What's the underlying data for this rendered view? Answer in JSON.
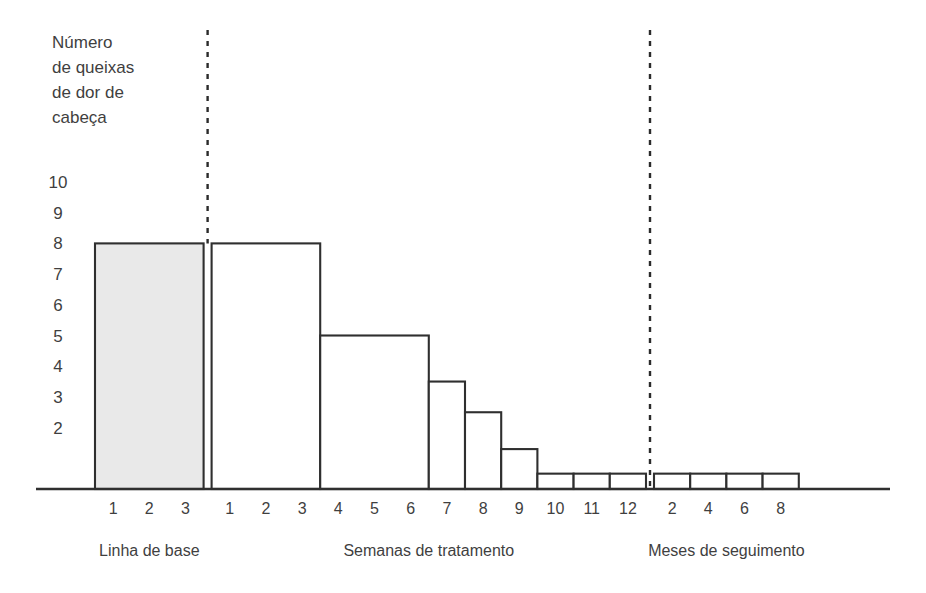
{
  "chart_data": {
    "type": "bar",
    "title": "",
    "ylabel": "Número de queixas de dor de cabeça",
    "ylabel_lines": [
      "Número",
      "de queixas",
      "de dor de",
      "cabeça"
    ],
    "xlabel": "",
    "ylim": [
      0,
      10
    ],
    "grid": false,
    "legend": "none",
    "y_ticks": [
      10,
      9,
      8,
      7,
      6,
      5,
      4,
      3,
      2
    ],
    "bar_fill_shaded": "#e9e9e9",
    "bar_fill_plain": "#ffffff",
    "bar_stroke": "#2f2f2f",
    "sections": [
      {
        "name": "baseline",
        "label": "Linha de base",
        "tick_labels": [
          "1",
          "2",
          "3"
        ],
        "bars": [
          {
            "label": "1-3",
            "span": 3,
            "value": 8,
            "shaded": true
          }
        ]
      },
      {
        "name": "treatment",
        "label": "Semanas de tratamento",
        "tick_labels": [
          "1",
          "2",
          "3",
          "4",
          "5",
          "6",
          "7",
          "8",
          "9",
          "10",
          "11",
          "12"
        ],
        "bars": [
          {
            "label": "1-3",
            "span": 3,
            "value": 8,
            "shaded": false
          },
          {
            "label": "4-6",
            "span": 3,
            "value": 5,
            "shaded": false
          },
          {
            "label": "7",
            "span": 1,
            "value": 3.5,
            "shaded": false
          },
          {
            "label": "8",
            "span": 1,
            "value": 2.5,
            "shaded": false
          },
          {
            "label": "9",
            "span": 1,
            "value": 1.3,
            "shaded": false
          },
          {
            "label": "10",
            "span": 1,
            "value": 0.5,
            "shaded": false
          },
          {
            "label": "11",
            "span": 1,
            "value": 0.5,
            "shaded": false
          },
          {
            "label": "12",
            "span": 1,
            "value": 0.5,
            "shaded": false
          }
        ]
      },
      {
        "name": "followup",
        "label": "Meses de seguimento",
        "tick_labels": [
          "2",
          "4",
          "6",
          "8"
        ],
        "bars": [
          {
            "label": "2",
            "span": 1,
            "value": 0.5,
            "shaded": false
          },
          {
            "label": "4",
            "span": 1,
            "value": 0.5,
            "shaded": false
          },
          {
            "label": "6",
            "span": 1,
            "value": 0.5,
            "shaded": false
          },
          {
            "label": "8",
            "span": 1,
            "value": 0.5,
            "shaded": false
          }
        ]
      }
    ],
    "dividers": [
      {
        "name": "baseline-treatment-divider",
        "after_section": "baseline"
      },
      {
        "name": "treatment-followup-divider",
        "after_section": "treatment"
      }
    ]
  },
  "geometry": {
    "axis_y": 489,
    "axis_x_start": 36,
    "axis_x_end": 890,
    "plot_left": 95,
    "unit_width": 36.2,
    "unit_height": 30.7,
    "ytick_x": 58,
    "ytick_top_y": 182,
    "xtick_label_y": 514,
    "section_label_y": 556,
    "divider_top_y": 30,
    "ylabel_x": 52,
    "ylabel_top_y": 48,
    "ylabel_line_height": 25,
    "baseline_gap": 8,
    "section_gap": 8
  }
}
